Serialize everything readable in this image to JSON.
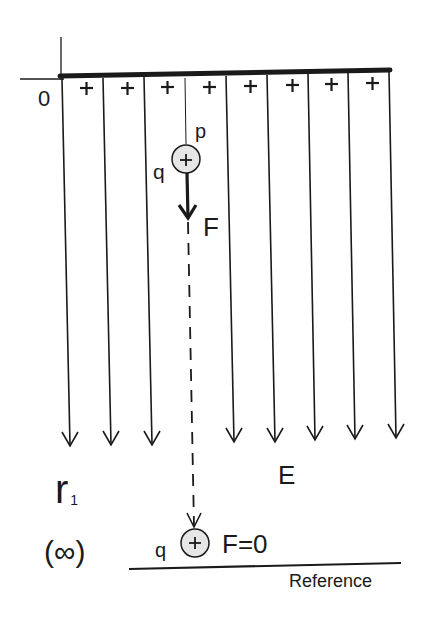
{
  "diagram": {
    "type": "electric-field-potential",
    "colors": {
      "ink": "#1a1a1a",
      "charge_fill": "#e6e6e6",
      "background": "#ffffff"
    },
    "labels": {
      "origin": "0",
      "point": "p",
      "charge_top": "q",
      "charge_symbol": "+",
      "force": "F",
      "distance": "r",
      "distance_subscript": "1",
      "field": "E",
      "infinity": "(∞)",
      "charge_bottom": "q",
      "force_zero": "F=0",
      "reference": "Reference"
    },
    "plate": {
      "charge_signs": [
        "+",
        "+",
        "+",
        "+",
        "+",
        "+",
        "+",
        "+"
      ]
    },
    "field_lines": {
      "count": 9,
      "direction": "down"
    }
  }
}
